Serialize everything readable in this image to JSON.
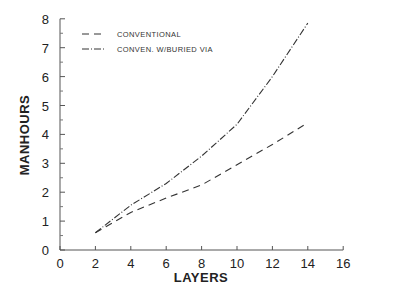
{
  "chart_data": {
    "type": "line",
    "title": "",
    "xlabel": "LAYERS",
    "ylabel": "MANHOURS",
    "xlim": [
      0,
      16
    ],
    "ylim": [
      0,
      8
    ],
    "x_ticks": [
      0,
      2,
      4,
      6,
      8,
      10,
      12,
      14,
      16
    ],
    "y_ticks": [
      0,
      1,
      2,
      3,
      4,
      5,
      6,
      7,
      8
    ],
    "grid": false,
    "legend_position": "upper left",
    "x": [
      2,
      4,
      6,
      8,
      10,
      12,
      14
    ],
    "series": [
      {
        "name": "CONVENTIONAL",
        "style": "dashed",
        "values": [
          0.6,
          1.3,
          1.8,
          2.25,
          2.95,
          3.65,
          4.4
        ]
      },
      {
        "name": "CONVEN. W/BURIED VIA",
        "style": "dash-dot",
        "values": [
          0.6,
          1.55,
          2.3,
          3.25,
          4.35,
          6.0,
          7.85
        ]
      }
    ]
  },
  "legend": {
    "items": [
      {
        "label": "CONVENTIONAL"
      },
      {
        "label": "CONVEN. W/BURIED VIA"
      }
    ]
  },
  "axes": {
    "x_title": "LAYERS",
    "y_title": "MANHOURS"
  }
}
